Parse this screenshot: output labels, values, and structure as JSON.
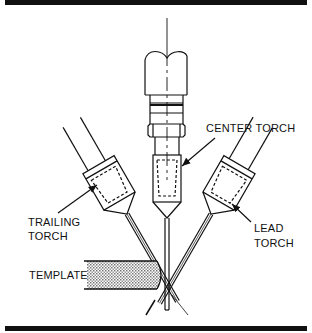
{
  "diagram": {
    "labels": {
      "center_torch": "CENTER TORCH",
      "trailing_torch_line1": "TRAILING",
      "trailing_torch_line2": "TORCH",
      "lead_torch_line1": "LEAD",
      "lead_torch_line2": "TORCH",
      "template": "TEMPLATE"
    },
    "colors": {
      "line": "#111111",
      "background": "#ffffff",
      "template_fill": "#bdbdbd"
    }
  }
}
